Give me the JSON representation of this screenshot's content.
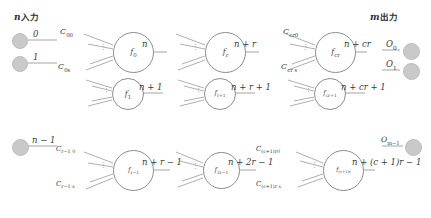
{
  "diagram": {
    "title_left_var": "n",
    "title_left_text": "入力",
    "title_right_var": "m",
    "title_right_text": "出力",
    "inputs": [
      {
        "label": "0"
      },
      {
        "label": "1"
      },
      {
        "label": "n − 1"
      }
    ],
    "outputs": [
      {
        "label": "O0"
      },
      {
        "label": "O1"
      },
      {
        "label": "Om−1"
      }
    ],
    "neurons": [
      {
        "name": "f0",
        "output": "n",
        "coef_top": "C00",
        "coef_bottom": "C0s"
      },
      {
        "name": "f1",
        "output": "n + 1",
        "coef_top": "",
        "coef_bottom": ""
      },
      {
        "name": "fr−1",
        "output": "n + r − 1",
        "coef_top": "Cr−1 0",
        "coef_bottom": "Cr−1 s"
      },
      {
        "name": "fr",
        "output": "n + r",
        "coef_top": "",
        "coef_bottom": ""
      },
      {
        "name": "fr+1",
        "output": "n + r + 1",
        "coef_top": "",
        "coef_bottom": ""
      },
      {
        "name": "f2r−1",
        "output": "n + 2r − 1",
        "coef_top": "",
        "coef_bottom": ""
      },
      {
        "name": "fcr",
        "output": "n + cr",
        "coef_top": "Ccr0",
        "coef_bottom": "Ccr s"
      },
      {
        "name": "fcr+1",
        "output": "n + cr + 1",
        "coef_top": "",
        "coef_bottom": ""
      },
      {
        "name": "f(c+1)r",
        "output": "n + (c + 1)r − 1",
        "coef_top": "C(c+1)r0",
        "coef_bottom": "C(c+1)r s"
      }
    ],
    "vertical_dots": "⋮",
    "colors": {
      "node_fill": "#c9c9c9",
      "line": "#9a9a9a",
      "text": "#3a3a3a"
    }
  }
}
